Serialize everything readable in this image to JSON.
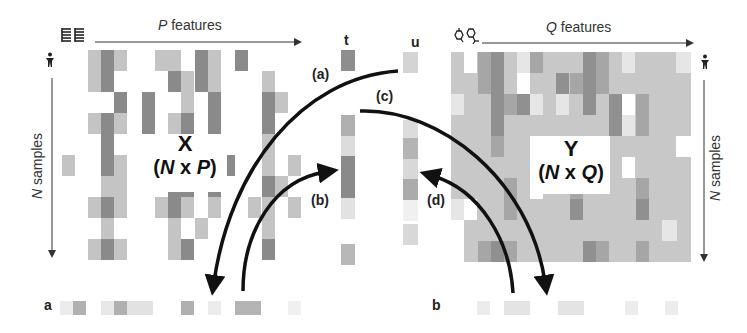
{
  "figure": {
    "left_matrix": {
      "name": "X",
      "dims": "(N x P)",
      "dims_parts": {
        "open": "(",
        "n": "N",
        "x": " x ",
        "p": "P",
        "close": ")"
      },
      "top_axis": {
        "var": "P",
        "text": " features"
      },
      "side_axis": {
        "var": "N",
        "text": " samples"
      },
      "feature_icon": "gene-expression-icon",
      "sample_icon": "person-icon"
    },
    "right_matrix": {
      "name": "Y",
      "dims_parts": {
        "open": "(",
        "n": "N",
        "x": " x ",
        "q": "Q",
        "close": ")"
      },
      "top_axis": {
        "var": "Q",
        "text": " features"
      },
      "side_axis": {
        "var": "N",
        "text": " samples"
      },
      "feature_icon": "molecule-icon",
      "sample_icon": "person-icon"
    },
    "vectors": {
      "t_label": "t",
      "u_label": "u",
      "a_label": "a",
      "b_label": "b"
    },
    "arrows": [
      {
        "label": "(a)",
        "from": "u",
        "to": "a"
      },
      {
        "label": "(b)",
        "from": "a",
        "to": "t"
      },
      {
        "label": "(c)",
        "from": "t",
        "to": "b"
      },
      {
        "label": "(d)",
        "from": "b",
        "to": "u"
      }
    ],
    "colors": {
      "dark": "#8a8a8a",
      "mid": "#a8a8a8",
      "light": "#c4c4c4",
      "pale": "#dcdcdc",
      "arrow": "#111111"
    }
  }
}
